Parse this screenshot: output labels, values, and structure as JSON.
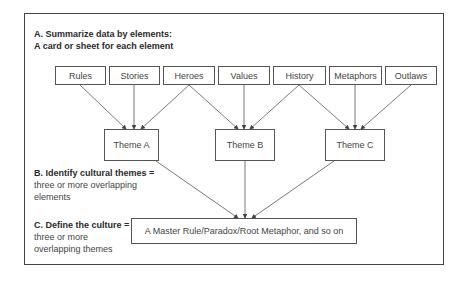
{
  "section_a": {
    "title": "A.  Summarize data by elements:",
    "subtitle": "A card or sheet for each element"
  },
  "elements": [
    {
      "label": "Rules"
    },
    {
      "label": "Stories"
    },
    {
      "label": "Heroes"
    },
    {
      "label": "Values"
    },
    {
      "label": "History"
    },
    {
      "label": "Metaphors"
    },
    {
      "label": "Outlaws"
    }
  ],
  "themes": [
    {
      "label": "Theme A"
    },
    {
      "label": "Theme B"
    },
    {
      "label": "Theme C"
    }
  ],
  "section_b": {
    "title": "B. Identify cultural themes =",
    "line1": "three or more overlapping",
    "line2": "elements"
  },
  "section_c": {
    "title": "C. Define the culture =",
    "line1": "three or more",
    "line2": "overlapping themes"
  },
  "master": {
    "label": "A Master Rule/Paradox/Root Metaphor, and so on"
  },
  "connections": [
    {
      "from": "Rules",
      "to": "Theme A"
    },
    {
      "from": "Stories",
      "to": "Theme A"
    },
    {
      "from": "Heroes",
      "to": "Theme A"
    },
    {
      "from": "Heroes",
      "to": "Theme B"
    },
    {
      "from": "Values",
      "to": "Theme B"
    },
    {
      "from": "History",
      "to": "Theme B"
    },
    {
      "from": "History",
      "to": "Theme C"
    },
    {
      "from": "Metaphors",
      "to": "Theme C"
    },
    {
      "from": "Outlaws",
      "to": "Theme C"
    },
    {
      "from": "Theme A",
      "to": "Master"
    },
    {
      "from": "Theme B",
      "to": "Master"
    },
    {
      "from": "Theme C",
      "to": "Master"
    }
  ]
}
